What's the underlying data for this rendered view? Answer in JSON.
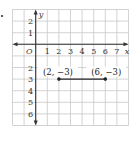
{
  "chart_data": {
    "type": "line",
    "title": "",
    "xlabel": "x",
    "ylabel": "y",
    "xlim": [
      -2,
      8
    ],
    "ylim": [
      -7,
      3
    ],
    "grid": true,
    "x_ticks": [
      "1",
      "2",
      "3",
      "4",
      "5",
      "6",
      "7"
    ],
    "y_ticks_positive": [
      "2",
      "1"
    ],
    "y_ticks_negative": [
      "2",
      "3",
      "4",
      "5",
      "6"
    ],
    "origin_label": "O",
    "series": [
      {
        "name": "segment",
        "points": [
          {
            "x": 2,
            "y": -3,
            "label": "(2, −3)"
          },
          {
            "x": 6,
            "y": -3,
            "label": "(6, −3)"
          }
        ]
      }
    ],
    "colors": {
      "grid": "#c8c8c8",
      "axis": "#333333",
      "segment": "#222222"
    }
  }
}
